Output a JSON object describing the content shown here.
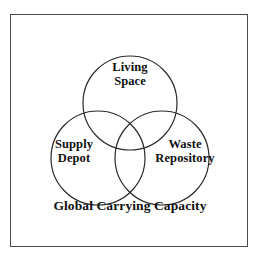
{
  "page": {
    "background_color": "#ffffff",
    "clipped_top_title": "— ———— —— ——",
    "text_color": "#101010"
  },
  "figure": {
    "frame": {
      "border_color": "#4a4a4a",
      "background_color": "#ffffff"
    },
    "caption": "Global Carrying Capacity"
  },
  "diagram": {
    "type": "venn-3-circle",
    "stroke_color": "#2a2a2a",
    "fill": "none",
    "circles": [
      {
        "id": "living-space",
        "label_line1": "Living",
        "label_line2": "Space",
        "cx": 119,
        "cy": 88,
        "r": 47
      },
      {
        "id": "supply-depot",
        "label_line1": "Supply",
        "label_line2": "Depot",
        "cx": 87,
        "cy": 143,
        "r": 47
      },
      {
        "id": "waste-repository",
        "label_line1": "Waste",
        "label_line2": "Repository",
        "cx": 151,
        "cy": 143,
        "r": 47
      }
    ]
  }
}
